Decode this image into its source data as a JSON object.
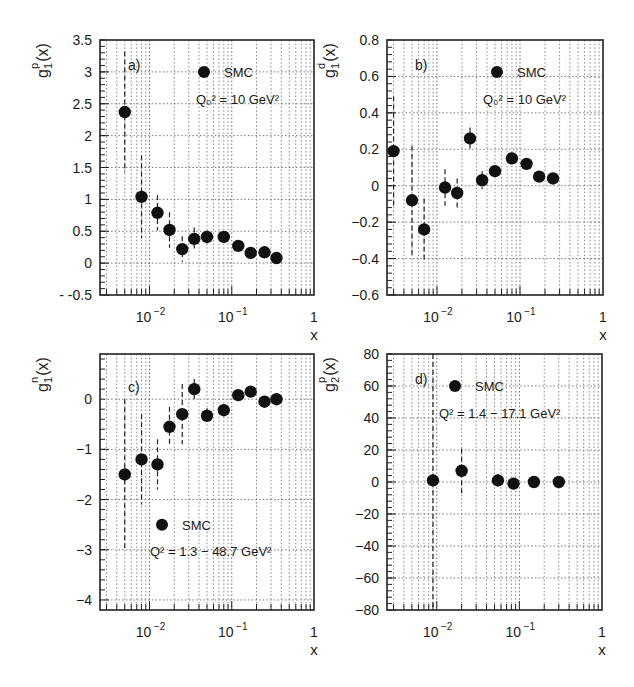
{
  "figure": {
    "width": 634,
    "height": 687
  },
  "chart_data": [
    {
      "type": "scatter",
      "panel_label": "a)",
      "ylabel": "g1p(x)",
      "ylabel_parts": {
        "base": "g",
        "sub": "1",
        "sup": "p",
        "tail": "(x)"
      },
      "xlabel": "x",
      "xscale": "log",
      "xlim": [
        0.0025,
        1
      ],
      "ylim": [
        -0.5,
        3.5
      ],
      "yticks": [
        -0.5,
        0,
        0.5,
        1,
        1.5,
        2,
        2.5,
        3,
        3.5
      ],
      "ytick_labels": [
        "- -0.5",
        "0",
        "0.5",
        "1",
        "1.5",
        "2",
        "2.5",
        "3",
        "3.5"
      ],
      "xticks": [
        0.01,
        0.1,
        1
      ],
      "xtick_labels": [
        "10⁻²",
        "10⁻¹",
        "1"
      ],
      "grid": true,
      "legend": {
        "label": "SMC",
        "position": "top-center"
      },
      "annotation": "Q₀² = 10 GeV²",
      "frame": {
        "left": 100,
        "top": 40,
        "right": 314,
        "bottom": 295
      },
      "series": [
        {
          "name": "SMC",
          "x": [
            0.005,
            0.008,
            0.0125,
            0.0175,
            0.025,
            0.035,
            0.05,
            0.08,
            0.12,
            0.17,
            0.25,
            0.35
          ],
          "y": [
            2.37,
            1.04,
            0.79,
            0.52,
            0.22,
            0.38,
            0.41,
            0.41,
            0.27,
            0.16,
            0.17,
            0.08
          ],
          "err": [
            0.95,
            0.65,
            0.28,
            0.28,
            0.2,
            0.18,
            0.1,
            0.07,
            0.06,
            0.05,
            0.05,
            0.04
          ]
        }
      ]
    },
    {
      "type": "scatter",
      "panel_label": "b)",
      "ylabel": "g1d(x)",
      "ylabel_parts": {
        "base": "g",
        "sub": "1",
        "sup": "d",
        "tail": "(x)"
      },
      "xlabel": "x",
      "xscale": "log",
      "xlim": [
        0.0025,
        1
      ],
      "ylim": [
        -0.6,
        0.8
      ],
      "yticks": [
        -0.6,
        -0.4,
        -0.2,
        0,
        0.2,
        0.4,
        0.6,
        0.8
      ],
      "ytick_labels": [
        "−0.6",
        "−0.4",
        "−0.2",
        "0",
        "0.2",
        "0.4",
        "0.6",
        "0.8"
      ],
      "xticks": [
        0.01,
        0.1,
        1
      ],
      "xtick_labels": [
        "10⁻²",
        "10⁻¹",
        "1"
      ],
      "grid": true,
      "legend": {
        "label": "SMC",
        "position": "top-center"
      },
      "annotation": "Q₀² = 10 GeV²",
      "frame": {
        "left": 387,
        "top": 40,
        "right": 603,
        "bottom": 295
      },
      "series": [
        {
          "name": "SMC",
          "x": [
            0.003,
            0.005,
            0.007,
            0.0125,
            0.0175,
            0.025,
            0.035,
            0.05,
            0.08,
            0.12,
            0.17,
            0.25
          ],
          "y": [
            0.19,
            -0.08,
            -0.24,
            -0.01,
            -0.04,
            0.26,
            0.03,
            0.08,
            0.15,
            0.12,
            0.05,
            0.04
          ],
          "err": [
            0.3,
            0.3,
            0.17,
            0.1,
            0.08,
            0.06,
            0.05,
            0.03,
            0.03,
            0.03,
            0.02,
            0.02
          ]
        }
      ]
    },
    {
      "type": "scatter",
      "panel_label": "c)",
      "ylabel": "g1n(x)",
      "ylabel_parts": {
        "base": "g",
        "sub": "1",
        "sup": "n",
        "tail": "(x)"
      },
      "xlabel": "x",
      "xscale": "log",
      "xlim": [
        0.0025,
        1
      ],
      "ylim": [
        -4.2,
        0.9
      ],
      "yticks": [
        -4,
        -3,
        -2,
        -1,
        0
      ],
      "ytick_labels": [
        "−4",
        "−3",
        "−2",
        "−1",
        "0"
      ],
      "xticks": [
        0.01,
        0.1,
        1
      ],
      "xtick_labels": [
        "10⁻²",
        "10⁻¹",
        "1"
      ],
      "grid": true,
      "legend": {
        "label": "SMC",
        "position": "lower-center"
      },
      "annotation": "Q² = 1.3 − 48.7 GeV²",
      "frame": {
        "left": 100,
        "top": 354,
        "right": 314,
        "bottom": 610
      },
      "series": [
        {
          "name": "SMC",
          "x": [
            0.005,
            0.008,
            0.0125,
            0.0175,
            0.025,
            0.035,
            0.05,
            0.08,
            0.12,
            0.17,
            0.25,
            0.35
          ],
          "y": [
            -1.5,
            -1.2,
            -1.3,
            -0.55,
            -0.3,
            0.2,
            -0.33,
            -0.22,
            0.08,
            0.15,
            -0.05,
            0.0
          ],
          "err": [
            1.5,
            0.9,
            0.5,
            0.4,
            0.6,
            0.2,
            0.15,
            0.12,
            0.1,
            0.1,
            0.08,
            0.08
          ]
        }
      ]
    },
    {
      "type": "scatter",
      "panel_label": "d)",
      "ylabel": "g2p(x)",
      "ylabel_parts": {
        "base": "g",
        "sub": "2",
        "sup": "p",
        "tail": "(x)"
      },
      "xlabel": "x",
      "xscale": "log",
      "xlim": [
        0.0025,
        1
      ],
      "ylim": [
        -80,
        80
      ],
      "yticks": [
        -80,
        -60,
        -40,
        -20,
        0,
        20,
        40,
        60,
        80
      ],
      "ytick_labels": [
        "−80",
        "−60",
        "−40",
        "−20",
        "0",
        "20",
        "40",
        "60",
        "80"
      ],
      "xticks": [
        0.01,
        0.1,
        1
      ],
      "xtick_labels": [
        "10⁻²",
        "10⁻¹",
        "1"
      ],
      "grid": true,
      "legend": {
        "label": "SMC",
        "position": "top-center"
      },
      "annotation": "Q² = 1.4 − 17.1 GeV²",
      "frame": {
        "left": 387,
        "top": 354,
        "right": 602,
        "bottom": 610
      },
      "series": [
        {
          "name": "SMC",
          "x": [
            0.009,
            0.02,
            0.055,
            0.085,
            0.15,
            0.3
          ],
          "y": [
            1,
            7,
            1,
            -1,
            0,
            0
          ],
          "err": [
            80,
            14,
            4,
            2,
            1.5,
            1.5
          ]
        }
      ]
    }
  ]
}
